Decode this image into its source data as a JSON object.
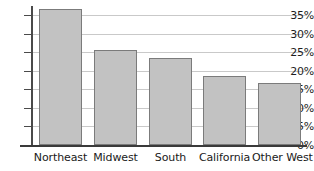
{
  "chart_data": {
    "type": "bar",
    "title": "",
    "subtitle": "",
    "xlabel": "",
    "ylabel": "",
    "categories": [
      "Northeast",
      "Midwest",
      "South",
      "California",
      "Other West"
    ],
    "values": [
      36.5,
      25.5,
      23.5,
      18.5,
      16.8
    ],
    "value_unit": "%",
    "ylim": [
      0,
      35
    ],
    "ytick_values": [
      0,
      5,
      10,
      15,
      20,
      25,
      30,
      35
    ],
    "ytick_labels": [
      "0%",
      "5%",
      "10%",
      "15%",
      "20%",
      "25%",
      "30%",
      "35%"
    ],
    "grid": true,
    "grid_axis": "y",
    "legend": false,
    "legend_position": "none",
    "series": [
      {
        "name": "",
        "values": [
          36.5,
          25.5,
          23.5,
          18.5,
          16.8
        ]
      }
    ],
    "colors": {
      "bar_fill": "#c2c2c2",
      "bar_border": "#7b7b7b",
      "gridline": "#c9c9c9",
      "axis": "#3a3a3a",
      "text": "#1a1a1a",
      "background": "#ffffff"
    }
  }
}
